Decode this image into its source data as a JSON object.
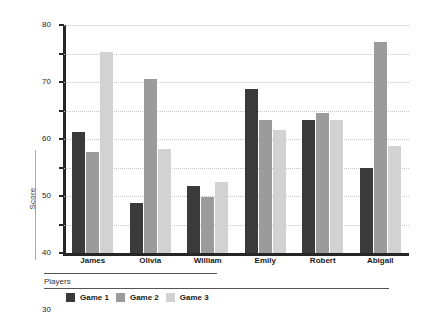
{
  "chart_data": {
    "type": "bar",
    "title": "",
    "xlabel": "Players",
    "ylabel": "Score",
    "ylim": [
      0,
      80
    ],
    "yticks": [
      0,
      10,
      20,
      30,
      40,
      50,
      60,
      70,
      80
    ],
    "grid": true,
    "legend_position": "bottom",
    "categories": [
      "James",
      "Olivia",
      "William",
      "Emily",
      "Robert",
      "Abigail"
    ],
    "series": [
      {
        "name": "Game 1",
        "color": "#3a3a3a",
        "values": [
          42.5,
          17.5,
          23.5,
          57.5,
          46.5,
          30
        ]
      },
      {
        "name": "Game 2",
        "color": "#9b9b9b",
        "values": [
          35.5,
          61,
          19.5,
          46.5,
          49,
          74
        ]
      },
      {
        "name": "Game 3",
        "color": "#d2d2d2",
        "values": [
          70.5,
          36.5,
          25,
          43,
          46.5,
          37.5
        ]
      }
    ]
  },
  "axis": {
    "y_label": "Score",
    "x_label": "Players",
    "y_tick_labels": [
      "80",
      "70",
      "60",
      "50",
      "40",
      "30",
      "20",
      "10",
      "0"
    ]
  },
  "legend": {
    "items": [
      {
        "label": "Game 1",
        "color": "#3a3a3a"
      },
      {
        "label": "Game 2",
        "color": "#9b9b9b"
      },
      {
        "label": "Game 3",
        "color": "#d2d2d2"
      }
    ]
  }
}
